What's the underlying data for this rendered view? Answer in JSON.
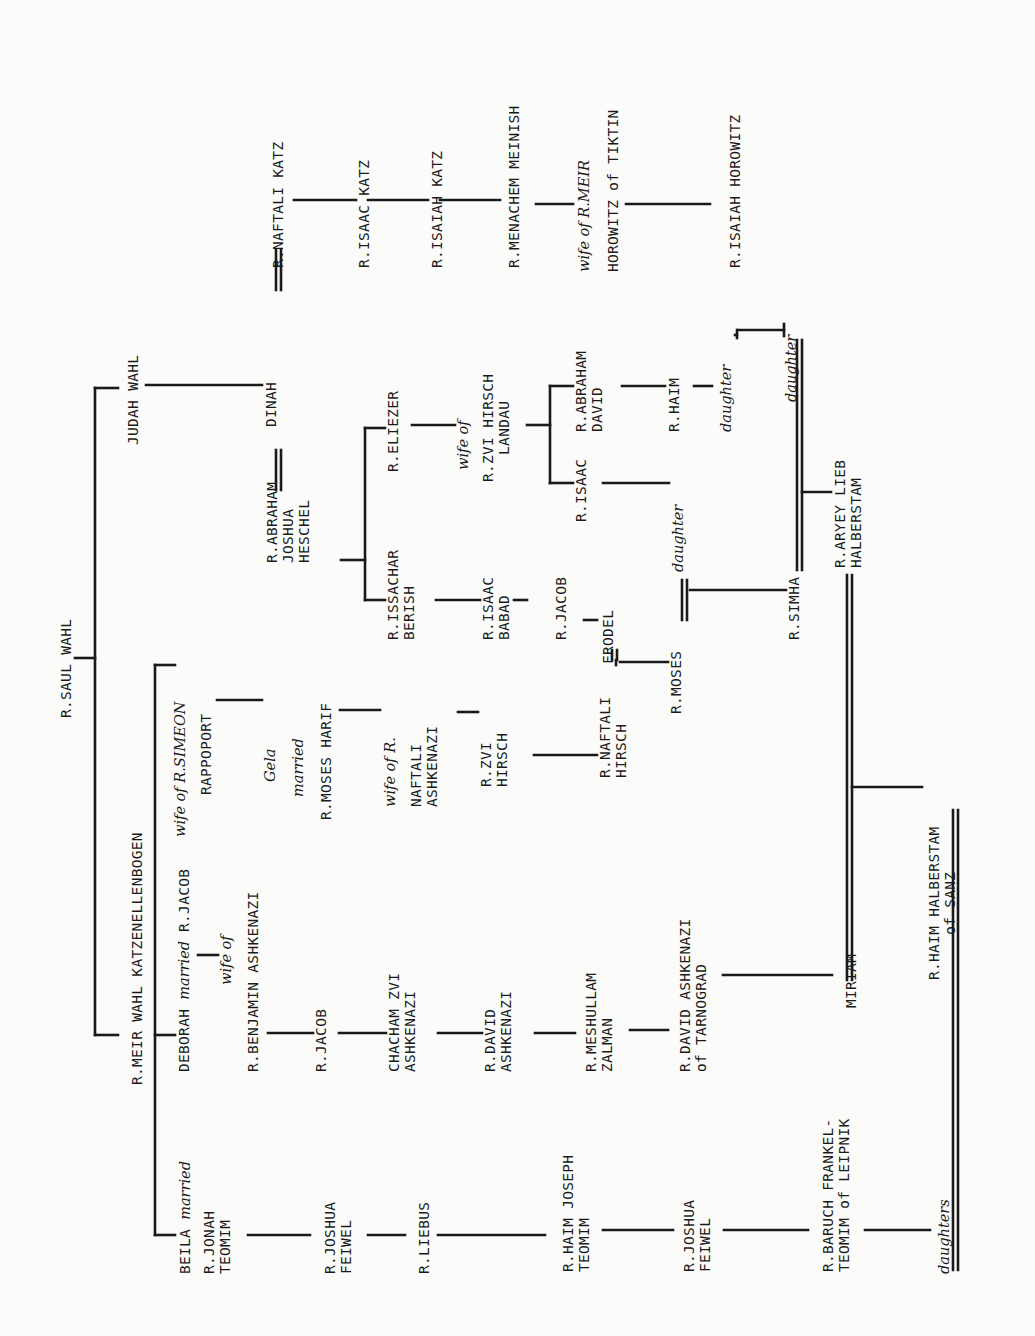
{
  "diagram": {
    "type": "genealogy-tree",
    "orientation": "rotated-90-ccw",
    "root": "R.SAUL WAHL",
    "nodes": {
      "saul_wahl": "R.SAUL WAHL",
      "judah_wahl": "JUDAH WAHL",
      "meir_wahl": "R.MEIR WAHL KATZENELLENBOGEN",
      "dinah": "DINAH",
      "naftali_katz": "R.NAFTALI KATZ",
      "isaac_katz": "R.ISAAC KATZ",
      "isaiah_katz": "R.ISAIAH KATZ",
      "menachem_meinish": "R.MENACHEM MEINISH",
      "wife_meir_horowitz_1": "wife of R.MEIR",
      "wife_meir_horowitz_2": "HOROWITZ of TIKTIN",
      "isaiah_horowitz": "R.ISAIAH HOROWITZ",
      "abraham_joshua_heschel": "R.ABRAHAM\nJOSHUA\nHESCHEL",
      "issachar_berish": "R.ISSACHAR\nBERISH",
      "eliezer": "R.ELIEZER",
      "wife_zvi_landau_1": "wife of",
      "wife_zvi_landau_2": "R.ZVI HIRSCH\nLANDAU",
      "isaac_babad": "R.ISAAC\nBABAD",
      "jacob_babad": "R.JACOB",
      "frodel": "FRODEL",
      "isaac_landau": "R.ISAAC",
      "abraham_david": "R.ABRAHAM\nDAVID",
      "haim_landau": "R.HAIM",
      "daughter_haim": "daughter",
      "daughter_isaac": "daughter",
      "isaiah_horowitz_spouse_daughter": "daughter",
      "wife_simeon_1": "wife of R.SIMEON",
      "wife_simeon_2": "RAPPOPORT",
      "gela_1": "Gela",
      "gela_2": "married",
      "gela_3": "R.MOSES HARIF",
      "wife_naftali_1": "wife of R.",
      "wife_naftali_2": "NAFTALI\nASHKENAZI",
      "zvi_hirsch": "R.ZVI\nHIRSCH",
      "naftali_hirsch": "R.NAFTALI\nHIRSCH",
      "moses": "R.MOSES",
      "simha": "R.SIMHA",
      "aryey_lieb": "R.ARYEY LIEB\nHALBERSTAM",
      "haim_halberstam": "R.HAIM HALBERSTAM\nof SANZ",
      "deborah_1": "DEBORAH",
      "deborah_married": "married",
      "deborah_2": "R.JACOB",
      "wife_benjamin_1": "wife of",
      "wife_benjamin_2": "R.BENJAMIN ASHKENAZI",
      "jacob_ashk": "R.JACOB",
      "chacham_zvi": "CHACHAM ZVI\nASHKENAZI",
      "david_ashk": "R.DAVID\nASHKENAZI",
      "meshullam_zalman": "R.MESHULLAM\nZALMAN",
      "david_tarnograd": "R.DAVID ASHKENAZI\nof TARNOGRAD",
      "miriam": "MIRIAM",
      "beila_1": "BEILA",
      "beila_married": "married",
      "beila_2": "R.JONAH\nTEOMIM",
      "joshua_feiwel_1": "R.JOSHUA\nFEIWEL",
      "liebus": "R.LIEBUS",
      "haim_joseph": "R.HAIM JOSEPH\nTEOMIM",
      "joshua_feiwel_2": "R.JOSHUA\nFEIWEL",
      "baruch_frankel": "R.BARUCH FRANKEL-\nTEOMIM of LEIPNIK",
      "daughters": "daughters"
    },
    "edges": [
      [
        "R.SAUL WAHL",
        "JUDAH WAHL"
      ],
      [
        "R.SAUL WAHL",
        "R.MEIR WAHL KATZENELLENBOGEN"
      ],
      [
        "JUDAH WAHL",
        "DINAH"
      ],
      [
        "DINAH",
        "R.ABRAHAM JOSHUA HESCHEL",
        "married"
      ],
      [
        "DINAH",
        "R.NAFTALI KATZ",
        "married"
      ],
      [
        "R.NAFTALI KATZ",
        "R.ISAAC KATZ"
      ],
      [
        "R.ISAAC KATZ",
        "R.ISAIAH KATZ"
      ],
      [
        "R.ISAIAH KATZ",
        "R.MENACHEM MEINISH"
      ],
      [
        "R.MENACHEM MEINISH",
        "wife of R.MEIR HOROWITZ of TIKTIN"
      ],
      [
        "wife of R.MEIR HOROWITZ of TIKTIN",
        "R.ISAIAH HOROWITZ"
      ],
      [
        "R.ABRAHAM JOSHUA HESCHEL",
        "R.ISSACHAR BERISH"
      ],
      [
        "R.ABRAHAM JOSHUA HESCHEL",
        "R.ELIEZER"
      ],
      [
        "R.ELIEZER",
        "wife of R.ZVI HIRSCH LANDAU"
      ],
      [
        "wife of R.ZVI HIRSCH LANDAU",
        "R.ISAAC"
      ],
      [
        "wife of R.ZVI HIRSCH LANDAU",
        "R.ABRAHAM DAVID"
      ],
      [
        "R.ABRAHAM DAVID",
        "R.HAIM"
      ],
      [
        "R.HAIM",
        "daughter"
      ],
      [
        "daughter",
        "R.ISAIAH HOROWITZ",
        "married"
      ],
      [
        "R.ISAIAH HOROWITZ",
        "daughter (wife of R.SIMHA)"
      ],
      [
        "R.ISSACHAR BERISH",
        "R.ISAAC BABAD"
      ],
      [
        "R.ISAAC BABAD",
        "R.JACOB"
      ],
      [
        "R.JACOB",
        "FRODEL"
      ],
      [
        "FRODEL",
        "R.NAFTALI HIRSCH",
        "married"
      ],
      [
        "R.ISAAC",
        "daughter (wife of R.MOSES)"
      ],
      [
        "R.MOSES",
        "daughter",
        "married"
      ],
      [
        "R.MOSES",
        "R.SIMHA"
      ],
      [
        "R.SIMHA",
        "daughter",
        "married"
      ],
      [
        "R.SIMHA",
        "R.ARYEY LIEB HALBERSTAM"
      ],
      [
        "R.ARYEY LIEB HALBERSTAM",
        "MIRIAM",
        "married"
      ],
      [
        "MIRIAM",
        "R.HAIM HALBERSTAM of SANZ"
      ],
      [
        "R.HAIM HALBERSTAM of SANZ",
        "daughters",
        "married"
      ],
      [
        "R.MEIR WAHL KATZENELLENBOGEN",
        "BEILA married R.JONAH TEOMIM"
      ],
      [
        "R.MEIR WAHL KATZENELLENBOGEN",
        "DEBORAH married R.JACOB"
      ],
      [
        "R.MEIR WAHL KATZENELLENBOGEN",
        "wife of R.SIMEON RAPPOPORT"
      ],
      [
        "wife of R.SIMEON RAPPOPORT",
        "Gela married R.MOSES HARIF"
      ],
      [
        "Gela married R.MOSES HARIF",
        "wife of R.NAFTALI ASHKENAZI"
      ],
      [
        "wife of R.NAFTALI ASHKENAZI",
        "R.ZVI HIRSCH"
      ],
      [
        "R.ZVI HIRSCH",
        "R.NAFTALI HIRSCH"
      ],
      [
        "R.NAFTALI HIRSCH",
        "R.MOSES"
      ],
      [
        "DEBORAH married R.JACOB",
        "wife of R.BENJAMIN ASHKENAZI"
      ],
      [
        "wife of R.BENJAMIN ASHKENAZI",
        "R.JACOB"
      ],
      [
        "R.JACOB",
        "CHACHAM ZVI ASHKENAZI"
      ],
      [
        "CHACHAM ZVI ASHKENAZI",
        "R.DAVID ASHKENAZI"
      ],
      [
        "R.DAVID ASHKENAZI",
        "R.MESHULLAM ZALMAN"
      ],
      [
        "R.MESHULLAM ZALMAN",
        "R.DAVID ASHKENAZI of TARNOGRAD"
      ],
      [
        "R.DAVID ASHKENAZI of TARNOGRAD",
        "MIRIAM"
      ],
      [
        "BEILA married R.JONAH TEOMIM",
        "R.JOSHUA FEIWEL"
      ],
      [
        "R.JOSHUA FEIWEL",
        "R.LIEBUS"
      ],
      [
        "R.LIEBUS",
        "R.HAIM JOSEPH TEOMIM"
      ],
      [
        "R.HAIM JOSEPH TEOMIM",
        "R.JOSHUA FEIWEL"
      ],
      [
        "R.JOSHUA FEIWEL",
        "R.BARUCH FRANKEL-TEOMIM of LEIPNIK"
      ],
      [
        "R.BARUCH FRANKEL-TEOMIM of LEIPNIK",
        "daughters"
      ]
    ]
  },
  "colors": {
    "paper": "#fbfbf9",
    "ink": "#1a1a1a"
  }
}
